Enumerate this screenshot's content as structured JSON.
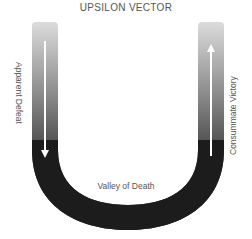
{
  "title": "UPSILON VECTOR",
  "labels": {
    "left": "Apparent Defeat",
    "right": "Consummate Victory",
    "bottom": "Valley of Death"
  },
  "colors": {
    "band_dark": "#1c1c1c",
    "band_light": "#d8d8d8",
    "arrow": "#ffffff",
    "text": "#555555"
  }
}
